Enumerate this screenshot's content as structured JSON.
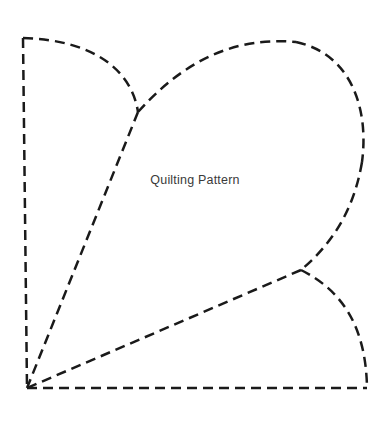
{
  "document": {
    "title": "Quilting Pattern",
    "background_color": "#ffffff"
  },
  "label": {
    "text": "Quilting Pattern",
    "color": "#3a3a3a",
    "center_x": 224,
    "center_y": 182
  },
  "pattern": {
    "name": "quilting-pattern-template",
    "stroke_color": "#1a1a1a",
    "stroke_width": 2.5,
    "dash_pattern": "10 6",
    "corners": {
      "top_left": [
        23,
        38
      ],
      "bottom_left": [
        27,
        388
      ],
      "bottom_right": [
        367,
        388
      ]
    },
    "junctions": {
      "upper": [
        138,
        112
      ],
      "lower": [
        301,
        270
      ]
    },
    "segments": [
      {
        "name": "left-vertical-edge",
        "type": "line",
        "from": [
          23,
          38
        ],
        "to": [
          27,
          388
        ]
      },
      {
        "name": "bottom-horizontal-edge",
        "type": "line",
        "from": [
          27,
          388
        ],
        "to": [
          367,
          388
        ]
      },
      {
        "name": "small-left-petal-arc",
        "type": "curve",
        "from": [
          23,
          38
        ],
        "control_1": [
          96,
          40
        ],
        "control_2": [
          132,
          72
        ],
        "to": [
          138,
          112
        ]
      },
      {
        "name": "large-petal-top-arc",
        "type": "curve",
        "from": [
          138,
          112
        ],
        "control_1": [
          196,
          47
        ],
        "control_2": [
          252,
          38
        ],
        "to": [
          296,
          42
        ]
      },
      {
        "name": "large-petal-right-arc",
        "type": "curve",
        "from": [
          296,
          42
        ],
        "control_1": [
          352,
          54
        ],
        "control_2": [
          369,
          110
        ],
        "to": [
          362,
          162
        ]
      },
      {
        "name": "large-petal-lower-right-arc",
        "type": "curve",
        "from": [
          362,
          162
        ],
        "control_1": [
          353,
          216
        ],
        "control_2": [
          327,
          248
        ],
        "to": [
          301,
          270
        ]
      },
      {
        "name": "upper-spine-line",
        "type": "line",
        "from": [
          138,
          112
        ],
        "to": [
          27,
          388
        ]
      },
      {
        "name": "lower-spine-line",
        "type": "line",
        "from": [
          301,
          270
        ],
        "to": [
          27,
          388
        ]
      },
      {
        "name": "small-right-petal-arc",
        "type": "curve",
        "from": [
          301,
          270
        ],
        "control_1": [
          345,
          292
        ],
        "control_2": [
          366,
          330
        ],
        "to": [
          367,
          388
        ]
      }
    ]
  }
}
